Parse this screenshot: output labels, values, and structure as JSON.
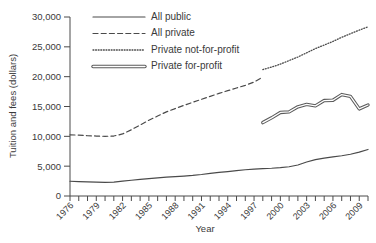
{
  "chart_data": {
    "type": "line",
    "title": "",
    "xlabel": "Year",
    "ylabel": "Tuition and fees (dollars)",
    "xlim": [
      1976,
      2010
    ],
    "ylim": [
      0,
      30000
    ],
    "grid": false,
    "legend_position": "top-center",
    "ytick_labels": [
      "0",
      "5,000",
      "10,000",
      "15,000",
      "20,000",
      "25,000",
      "30,000"
    ],
    "ytick_values": [
      0,
      5000,
      10000,
      15000,
      20000,
      25000,
      30000
    ],
    "xtick_labels": [
      "1976",
      "1979",
      "1982",
      "1985",
      "1988",
      "1991",
      "1994",
      "1997",
      "2000",
      "2003",
      "2006",
      "2009"
    ],
    "xtick_values": [
      1976,
      1979,
      1982,
      1985,
      1988,
      1991,
      1994,
      1997,
      2000,
      2003,
      2006,
      2009
    ],
    "xminor_step": 1,
    "series": [
      {
        "name": "All public",
        "style": "solid-thin",
        "color": "#4a4a4a",
        "x": [
          1976,
          1977,
          1978,
          1979,
          1980,
          1981,
          1982,
          1983,
          1984,
          1985,
          1986,
          1987,
          1988,
          1989,
          1990,
          1991,
          1992,
          1993,
          1994,
          1995,
          1996,
          1997,
          1998,
          1999,
          2000,
          2001,
          2002,
          2003,
          2004,
          2005,
          2006,
          2007,
          2008,
          2009,
          2010
        ],
        "values": [
          2470,
          2420,
          2370,
          2320,
          2280,
          2320,
          2480,
          2640,
          2780,
          2900,
          3050,
          3150,
          3250,
          3330,
          3440,
          3600,
          3800,
          3950,
          4100,
          4250,
          4400,
          4500,
          4600,
          4650,
          4750,
          4900,
          5200,
          5700,
          6100,
          6350,
          6550,
          6750,
          7000,
          7350,
          7800
        ]
      },
      {
        "name": "All private",
        "style": "dashed",
        "color": "#4a4a4a",
        "x": [
          1976,
          1977,
          1978,
          1979,
          1980,
          1981,
          1982,
          1983,
          1984,
          1985,
          1986,
          1987,
          1988,
          1989,
          1990,
          1991,
          1992,
          1993,
          1994,
          1995,
          1996,
          1997,
          1998
        ],
        "values": [
          10250,
          10200,
          10100,
          10050,
          10000,
          10050,
          10400,
          11100,
          11900,
          12700,
          13400,
          14100,
          14650,
          15200,
          15700,
          16200,
          16700,
          17200,
          17650,
          18100,
          18550,
          19100,
          19950
        ]
      },
      {
        "name": "Private not-for-profit",
        "style": "dotted",
        "color": "#4a4a4a",
        "x": [
          1998,
          1999,
          2000,
          2001,
          2002,
          2003,
          2004,
          2005,
          2006,
          2007,
          2008,
          2009,
          2010
        ],
        "values": [
          21200,
          21600,
          22100,
          22700,
          23300,
          24000,
          24700,
          25300,
          25900,
          26600,
          27200,
          27800,
          28350
        ]
      },
      {
        "name": "Private for-profit",
        "style": "solid-thick",
        "color": "#5a5a5a",
        "x": [
          1998,
          1999,
          2000,
          2001,
          2002,
          2003,
          2004,
          2005,
          2006,
          2007,
          2008,
          2009,
          2010
        ],
        "values": [
          12300,
          13100,
          14000,
          14100,
          14950,
          15350,
          15100,
          16000,
          16050,
          17000,
          16700,
          14600,
          15250
        ]
      }
    ]
  },
  "legend": {
    "items": [
      {
        "label": "All public",
        "style": "solid-thin"
      },
      {
        "label": "All private",
        "style": "dashed"
      },
      {
        "label": "Private not-for-profit",
        "style": "dotted"
      },
      {
        "label": "Private for-profit",
        "style": "solid-thick"
      }
    ]
  }
}
